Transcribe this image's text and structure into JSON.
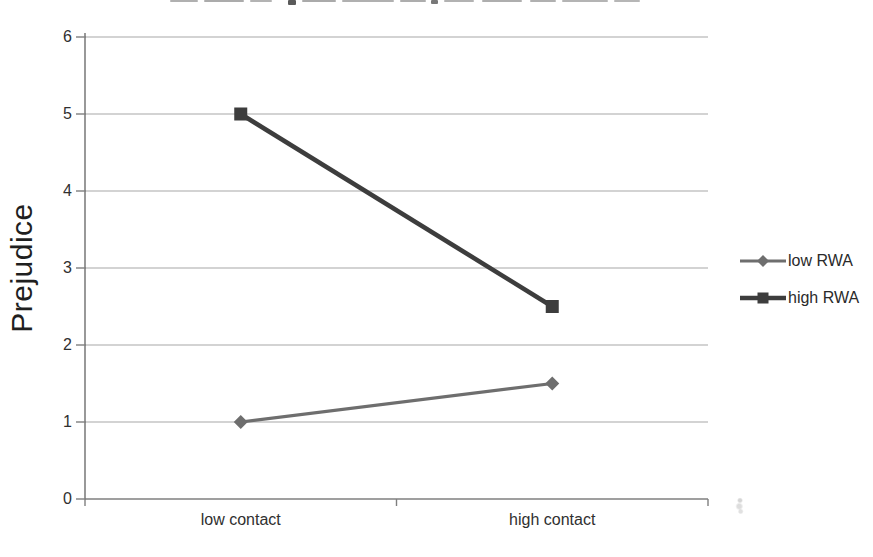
{
  "figure": {
    "note": "grayscale scanned line chart; chart title is cropped off at the top edge of the image"
  },
  "chart_data": {
    "type": "line",
    "title": "",
    "title_cropped_at_top_edge": true,
    "ylabel": "Prejudice",
    "xlabel": "",
    "categories": [
      "low contact",
      "high contact"
    ],
    "series": [
      {
        "name": "low RWA",
        "values": [
          1.0,
          1.5
        ],
        "marker": "diamond",
        "color": "#6e6e6e",
        "line_width": 3.2
      },
      {
        "name": "high RWA",
        "values": [
          5.0,
          2.5
        ],
        "marker": "square",
        "color": "#3d3d3d",
        "line_width": 4.6
      }
    ],
    "ylim": [
      0,
      6
    ],
    "yticks": [
      0,
      1,
      2,
      3,
      4,
      5,
      6
    ],
    "grid": "horizontal",
    "legend_position": "right",
    "colors": {
      "axis": "#7f7f7f",
      "gridline": "#a8a8a8",
      "text": "#303030",
      "background": "#ffffff"
    }
  }
}
